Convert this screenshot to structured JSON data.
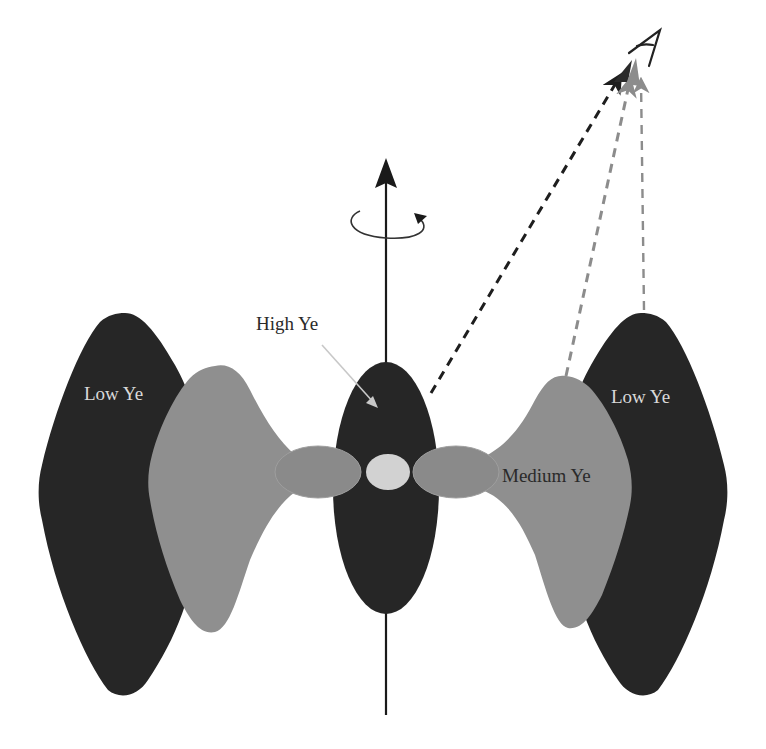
{
  "diagram": {
    "labels": {
      "high_ye": "High Ye",
      "medium_ye": "Medium Ye",
      "low_ye_left": "Low Ye",
      "low_ye_right": "Low Ye",
      "observer": "A"
    },
    "colors": {
      "background": "#ffffff",
      "low_ye_fill": "#262626",
      "high_ye_fill": "#262626",
      "medium_ye_fill": "#8f8f8f",
      "torus_lobe_fill": "#8a8a8a",
      "core_fill": "#d2d2d2",
      "axis_stroke": "#1a1a1a",
      "dash_black": "#1e1e1e",
      "dash_gray": "#8c8c8c",
      "light_text": "#d9d9d9",
      "dark_text": "#2a2a2a"
    },
    "components": [
      {
        "name": "rotation-axis",
        "kind": "arrow",
        "direction": "up"
      },
      {
        "name": "rotation-indicator",
        "kind": "circular-arrow"
      },
      {
        "name": "polar-ejecta",
        "ye": "High Ye"
      },
      {
        "name": "wind-ejecta-left",
        "ye": "Medium Ye"
      },
      {
        "name": "wind-ejecta-right",
        "ye": "Medium Ye"
      },
      {
        "name": "dynamical-ejecta-left",
        "ye": "Low Ye"
      },
      {
        "name": "dynamical-ejecta-right",
        "ye": "Low Ye"
      },
      {
        "name": "torus-left"
      },
      {
        "name": "torus-right"
      },
      {
        "name": "central-remnant"
      }
    ],
    "sight_lines": [
      {
        "from": "polar-ejecta",
        "to": "observer",
        "style": "dashed",
        "color": "black"
      },
      {
        "from": "wind-ejecta-right",
        "to": "observer",
        "style": "dashed",
        "color": "gray"
      },
      {
        "from": "dynamical-ejecta-right",
        "to": "observer",
        "style": "dashed",
        "color": "gray"
      }
    ]
  }
}
